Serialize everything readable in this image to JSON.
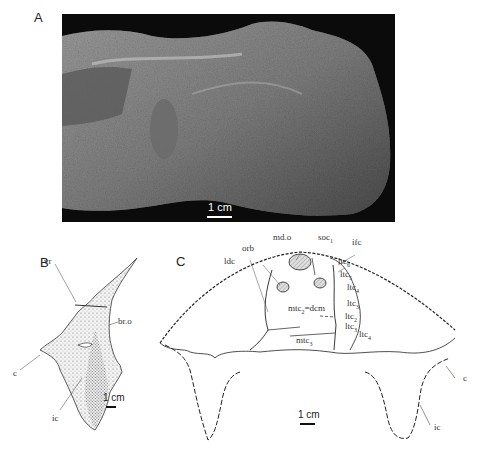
{
  "figure": {
    "panels": {
      "A": {
        "letter": "A",
        "scale_label": "1 cm",
        "description": "Photograph of fossil specimen on dark background"
      },
      "B": {
        "letter": "B",
        "scale_label": "1 cm",
        "labels": {
          "vr": "vr",
          "bro": "br.o",
          "c": "c",
          "ic": "ic"
        }
      },
      "C": {
        "letter": "C",
        "scale_label": "1 cm",
        "labels": {
          "mdo": "md.o",
          "soc": "soc",
          "soc_sub": "1",
          "ifc": "ifc",
          "orb": "orb",
          "ldc": "ldc",
          "ltc6": "ltc",
          "ltc6_sub": "6",
          "ltc5": "ltc",
          "ltc5_sub": "5",
          "ltc4a": "ltc",
          "ltc4a_sub": "4",
          "ltc3a": "ltc",
          "ltc3a_sub": "3",
          "ltc2": "ltc",
          "ltc2_sub": "2",
          "ltc3b": "ltc",
          "ltc3b_sub": "3",
          "ltc4b": "ltc",
          "ltc4b_sub": "4",
          "mtc2": "mtc",
          "mtc2_sub": "2",
          "mtc2_rest": "=dcm",
          "mtc3": "mtc",
          "mtc3_sub": "3",
          "c": "c",
          "ic": "ic"
        }
      }
    },
    "colors": {
      "photo_bg": "#0b0b0b",
      "rock": "#8a8a8a",
      "line": "#222222",
      "hatch_fill": "#d8d8d8"
    }
  }
}
